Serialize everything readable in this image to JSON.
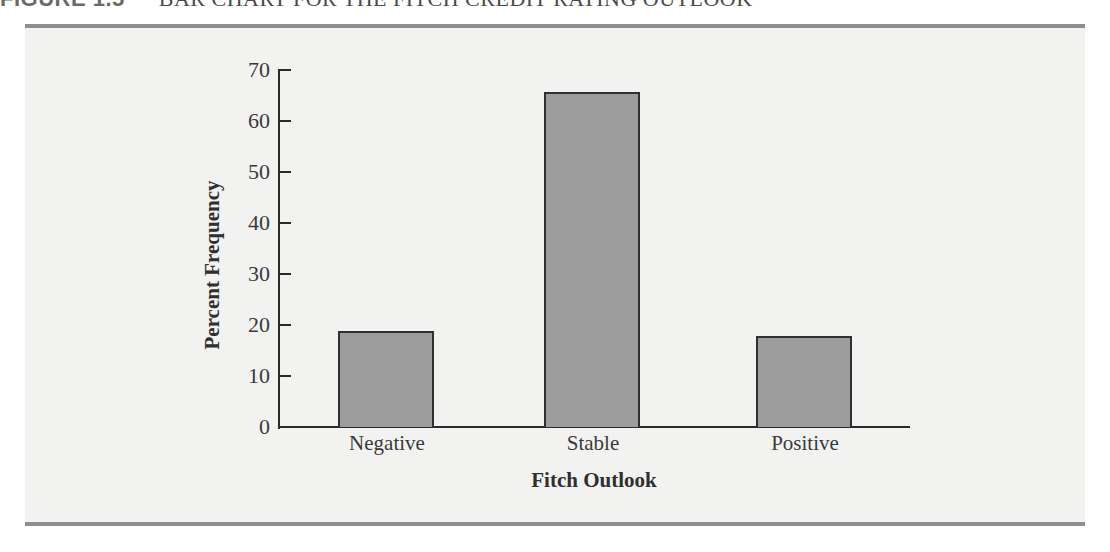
{
  "figure": {
    "label": "FIGURE 1.5",
    "title": "BAR CHART FOR THE FITCH CREDIT RATING OUTLOOK"
  },
  "chart_data": {
    "type": "bar",
    "title": "",
    "categories": [
      "Negative",
      "Stable",
      "Positive"
    ],
    "values": [
      18.8,
      65.6,
      17.8
    ],
    "xlabel": "Fitch Outlook",
    "ylabel": "Percent Frequency",
    "ylim": [
      0,
      70
    ],
    "yticks": [
      0,
      10,
      20,
      30,
      40,
      50,
      60,
      70
    ],
    "grid": false,
    "legend": null,
    "bar_color": "#9c9c9c",
    "bar_edge_color": "#2f2f2f"
  }
}
